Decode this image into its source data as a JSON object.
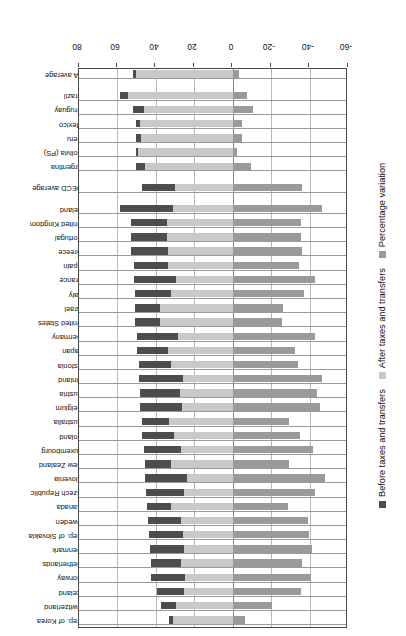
{
  "chart_data": {
    "type": "bar",
    "orientation": "vertical-rotated",
    "title": "",
    "subtitle": "",
    "xlabel": "",
    "ylabel": "Percentage variation",
    "ylim": [
      -60,
      80
    ],
    "yticks": [
      -60,
      -40,
      -20,
      0,
      20,
      40,
      60,
      80
    ],
    "ytick_labels": [
      "-60",
      "-40",
      "-20",
      "0",
      "20",
      "40",
      "60",
      "80"
    ],
    "grid": true,
    "legend_position": "bottom",
    "legend": [
      {
        "name": "Before taxes and transfers",
        "color": "#4d4d4d"
      },
      {
        "name": "After taxes and transfers",
        "color": "#c9c9c9"
      },
      {
        "name": "Percentage variation",
        "color": "#9a9a9a"
      }
    ],
    "categories": [
      "Rep. of Korea",
      "Switzerland",
      "Iceland",
      "Norway",
      "Netherlands",
      "Denmark",
      "Rep. of Slovakia",
      "Sweden",
      "Canada",
      "Czech Republic",
      "Slovenia",
      "New Zealand",
      "Luxembourg",
      "Poland",
      "Australia",
      "Belgium",
      "Austria",
      "Finland",
      "Estonia",
      "Japan",
      "Germany",
      "United States",
      "Israel",
      "Italy",
      "France",
      "Spain",
      "Greece",
      "Portugal",
      "United Kingdom",
      "Ireland",
      "OECD average",
      "Argentina",
      "Bolivia (PS)",
      "Peru",
      "Mexico",
      "Uruguay",
      "Brazil",
      "LA average"
    ],
    "group_breaks": [
      30,
      31,
      37
    ],
    "series": [
      {
        "name": "Before taxes and transfers",
        "color": "#4d4d4d",
        "values": [
          33.1,
          37.2,
          39.4,
          42.3,
          42.4,
          42.9,
          43.4,
          44.1,
          44.7,
          44.9,
          45.4,
          45.7,
          46.3,
          47.0,
          47.2,
          48.3,
          48.4,
          48.8,
          49.0,
          49.7,
          50.0,
          50.9,
          50.9,
          51.1,
          51.3,
          51.5,
          52.9,
          52.9,
          52.9,
          58.5,
          47.4,
          50.5,
          50.3,
          50.3,
          50.5,
          52.0,
          58.7,
          52.0
        ]
      },
      {
        "name": "After taxes and transfers",
        "color": "#c9c9c9",
        "values": [
          31.0,
          29.5,
          25.3,
          25.0,
          27.1,
          25.1,
          26.1,
          26.9,
          31.9,
          25.6,
          23.6,
          32.3,
          27.0,
          30.5,
          33.4,
          26.4,
          27.2,
          26.1,
          32.3,
          33.6,
          28.6,
          37.8,
          37.6,
          32.1,
          29.3,
          33.8,
          33.7,
          34.1,
          34.1,
          31.3,
          30.2,
          45.8,
          49.3,
          47.8,
          48.0,
          46.4,
          54.5,
          50.3
        ]
      },
      {
        "name": "Percentage variation",
        "color": "#9a9a9a",
        "values": [
          -6.3,
          -20.7,
          -35.8,
          -40.9,
          -36.1,
          -41.5,
          -39.9,
          -39.0,
          -28.6,
          -43.0,
          -48.0,
          -29.3,
          -41.7,
          -35.1,
          -29.2,
          -45.3,
          -43.8,
          -46.5,
          -34.1,
          -32.4,
          -42.8,
          -25.7,
          -26.1,
          -37.2,
          -42.9,
          -34.4,
          -36.3,
          -35.5,
          -35.5,
          -46.5,
          -36.3,
          -9.3,
          -2.0,
          -5.0,
          -4.9,
          -10.8,
          -7.2,
          -3.3
        ]
      }
    ]
  },
  "axis": {
    "value_axis_title": "Percentage variation"
  }
}
